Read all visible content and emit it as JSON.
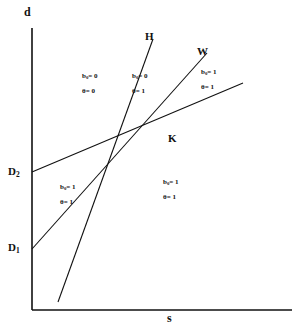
{
  "figure": {
    "type": "economics-phase-diagram",
    "background_color": "#ffffff",
    "ink_color": "#111111"
  },
  "axes": {
    "y_label": "d",
    "x_label": "s",
    "origin_label": ""
  },
  "points": [
    {
      "name": "D2",
      "label_html": "D<sub>2</sub>",
      "x": 22,
      "y": 172
    },
    {
      "name": "D1",
      "label_html": "D<sub>1</sub>",
      "x": 22,
      "y": 248
    },
    {
      "name": "K",
      "label_html": "K",
      "x": 168,
      "y": 135
    }
  ],
  "lines": [
    {
      "name": "H",
      "label": "H",
      "label_x": 146,
      "label_y": 32
    },
    {
      "name": "W",
      "label": "W",
      "label_x": 198,
      "label_y": 47
    }
  ],
  "regions": [
    {
      "name": "upper-left",
      "x": 82,
      "y": 72,
      "b0": "b<sub>0</sub>= 0",
      "theta": "θ = 0"
    },
    {
      "name": "upper-middle",
      "x": 132,
      "y": 72,
      "b0": "b<sub>0</sub>= 0",
      "theta": "θ = 1"
    },
    {
      "name": "upper-right",
      "x": 200,
      "y": 68,
      "b0": "b<sub>0</sub>= 1",
      "theta": "θ = 1"
    },
    {
      "name": "lower-left",
      "x": 60,
      "y": 183,
      "b0": "b<sub>0</sub>= 1",
      "theta": "θ = 1"
    },
    {
      "name": "lower-right",
      "x": 163,
      "y": 178,
      "b0": "b<sub>0</sub>= 1",
      "theta": "θ = 1"
    }
  ],
  "geometry": {
    "y_axis_x": 32,
    "y_axis_top": 28,
    "y_axis_bottom": 310,
    "x_axis_y": 310,
    "x_axis_left": 32,
    "x_axis_right": 290,
    "line_H": {
      "x1": 60,
      "y1": 300,
      "x2": 152,
      "y2": 38
    },
    "line_W": {
      "x1": 32,
      "y1": 248,
      "x2": 206,
      "y2": 52
    },
    "line_K": {
      "x1": 32,
      "y1": 172,
      "x2": 240,
      "y2": 82
    }
  }
}
